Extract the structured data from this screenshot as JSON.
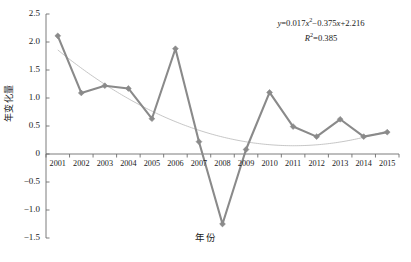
{
  "chart_data": {
    "type": "line",
    "title": "",
    "subtitle": "",
    "xlabel": "年份",
    "ylabel": "年变化量",
    "categories": [
      "2001",
      "2002",
      "2003",
      "2004",
      "2005",
      "2006",
      "2007",
      "2008",
      "2009",
      "2010",
      "2011",
      "2012",
      "2013",
      "2014",
      "2015"
    ],
    "values": [
      2.11,
      1.09,
      1.22,
      1.17,
      0.63,
      1.88,
      0.22,
      -1.25,
      0.08,
      1.1,
      0.49,
      0.31,
      0.62,
      0.31,
      0.39
    ],
    "series": [
      {
        "name": "年变化量",
        "values": [
          2.11,
          1.09,
          1.22,
          1.17,
          0.63,
          1.88,
          0.22,
          -1.25,
          0.08,
          1.1,
          0.49,
          0.31,
          0.62,
          0.31,
          0.39
        ],
        "color": "#8a8a8a",
        "marker": "diamond"
      },
      {
        "name": "trendline",
        "type": "polynomial",
        "order": 2,
        "coefficients": [
          0.017,
          -0.375,
          2.216
        ],
        "r_squared": 0.385,
        "values": [
          1.858,
          1.517,
          1.21,
          0.937,
          0.698,
          0.493,
          0.322,
          0.185,
          0.082,
          0.013,
          -0.022,
          -0.023,
          0.01,
          0.077,
          0.178
        ],
        "color": "#b8b8b8"
      }
    ],
    "ylim": [
      -1.5,
      2.5
    ],
    "yticks": [
      "2.5",
      "2.0",
      "1.5",
      "1.0",
      "0.5",
      "0",
      "-0.5",
      "-1.0",
      "-1.5"
    ],
    "ytick_values": [
      2.5,
      2.0,
      1.5,
      1.0,
      0.5,
      0,
      -0.5,
      -1.0,
      -1.5
    ],
    "grid": false,
    "legend": "none",
    "annotations": {
      "equation_line1_prefix": "y",
      "equation_line1": " = 0.017x2 − 0.375x + 2.216",
      "equation_text": "y = 0.017x² − 0.375x + 2.216",
      "r_squared_text": "R² = 0.385",
      "eq_y": "y",
      "eq_a": "=0.017",
      "eq_x1": "x",
      "eq_sup1": "2",
      "eq_b": "−0.375",
      "eq_x2": "x",
      "eq_c": "+2.216",
      "eq_r": "R",
      "eq_rsup": "2",
      "eq_rval": "=0.385"
    },
    "colors": {
      "series": "#8a8a8a",
      "trendline": "#b8b8b8",
      "axis": "#6e6e6e",
      "text": "#1a1a1a",
      "background": "#ffffff"
    }
  }
}
